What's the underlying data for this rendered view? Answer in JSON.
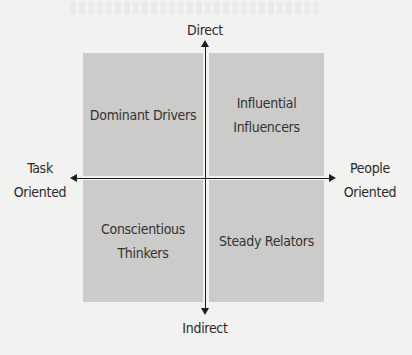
{
  "diagram": {
    "type": "quadrant",
    "axes": {
      "vertical": {
        "top_label": "Direct",
        "bottom_label": "Indirect"
      },
      "horizontal": {
        "left_label": "Task\nOriented",
        "right_label": "People\nOriented"
      }
    },
    "quadrants": {
      "top_left": "Dominant Drivers",
      "top_right": "Influential\nInfluencers",
      "bottom_left": "Conscientious\nThinkers",
      "bottom_right": "Steady Relators"
    },
    "colors": {
      "quadrant_fill": "#cbcbc9",
      "axis": "#1e1e1e",
      "background": "#f2f2f0",
      "text": "#2a2a2a"
    }
  }
}
